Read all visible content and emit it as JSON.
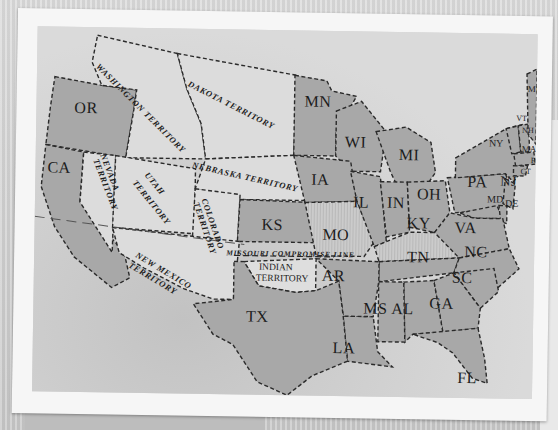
{
  "map": {
    "title": "United States, 1854 (Kansas-Nebraska era)",
    "colors": {
      "state_fill": "#a9a9a9",
      "territory_fill": "#dedede",
      "striped_fill": "#c7c7c7",
      "water": "#d4d4d4",
      "border": "#2a2a2a",
      "photo_border": "#f6f6f6"
    },
    "states": [
      {
        "abbr": "OR"
      },
      {
        "abbr": "CA"
      },
      {
        "abbr": "MN"
      },
      {
        "abbr": "WI"
      },
      {
        "abbr": "MI"
      },
      {
        "abbr": "IA"
      },
      {
        "abbr": "IL"
      },
      {
        "abbr": "IN"
      },
      {
        "abbr": "OH"
      },
      {
        "abbr": "PA"
      },
      {
        "abbr": "NY"
      },
      {
        "abbr": "VT"
      },
      {
        "abbr": "NH"
      },
      {
        "abbr": "ME"
      },
      {
        "abbr": "MA"
      },
      {
        "abbr": "RI"
      },
      {
        "abbr": "CT"
      },
      {
        "abbr": "NJ"
      },
      {
        "abbr": "MD"
      },
      {
        "abbr": "DE"
      },
      {
        "abbr": "VA"
      },
      {
        "abbr": "KY"
      },
      {
        "abbr": "MO"
      },
      {
        "abbr": "KS"
      },
      {
        "abbr": "TN"
      },
      {
        "abbr": "NC"
      },
      {
        "abbr": "SC"
      },
      {
        "abbr": "GA"
      },
      {
        "abbr": "AL"
      },
      {
        "abbr": "MS"
      },
      {
        "abbr": "LA"
      },
      {
        "abbr": "AR"
      },
      {
        "abbr": "TX"
      },
      {
        "abbr": "FL"
      }
    ],
    "territories": {
      "washington": "WASHINGTON TERRITORY",
      "dakota": "DAKOTA TERRITORY",
      "nebraska": "NEBRASKA TERRITORY",
      "nevada_1": "NEVADA",
      "nevada_2": "TERRITORY",
      "utah_1": "UTAH",
      "utah_2": "TERRITORY",
      "colorado_1": "COLORADO",
      "colorado_2": "TERRITORY",
      "new_mexico_1": "NEW MEXICO",
      "new_mexico_2": "TERRITORY",
      "indian_1": "INDIAN",
      "indian_2": "TERRITORY"
    },
    "annotations": {
      "missouri_compromise": "MISSOURI  COMPROMISE LINE"
    }
  }
}
